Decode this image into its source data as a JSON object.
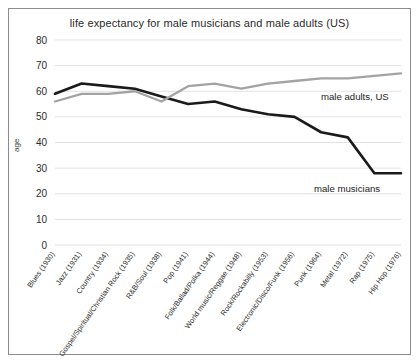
{
  "chart_data": {
    "type": "line",
    "title": "life expectancy for male musicians and male adults (US)",
    "xlabel": "",
    "ylabel": "age",
    "ylim": [
      0,
      80
    ],
    "ytick_values": [
      0,
      10,
      20,
      30,
      40,
      50,
      60,
      70,
      80
    ],
    "grid": true,
    "legend_position": "inline-annotation",
    "categories": [
      "Blues (1930)",
      "Jazz (1931)",
      "Country (1934)",
      "Gospel/Spiritual/Christian Rock (1935)",
      "R&B/Soul (1938)",
      "Pop (1941)",
      "Folk/Ballad/Polka (1944)",
      "World music/Reggae (1948)",
      "Rock/Rockabilly (1953)",
      "Electronic/Disco/Funk (1956)",
      "Punk (1964)",
      "Metal (1972)",
      "Rap (1975)",
      "Hip Hop (1976)"
    ],
    "series": [
      {
        "name": "male musicians",
        "color": "#1a1a1a",
        "values": [
          59,
          63,
          62,
          61,
          58,
          55,
          56,
          53,
          51,
          50,
          44,
          42,
          28,
          28
        ]
      },
      {
        "name": "male adults, US",
        "color": "#a3a3a3",
        "values": [
          56,
          59,
          59,
          60,
          56,
          62,
          63,
          61,
          63,
          64,
          65,
          65,
          66,
          67
        ]
      }
    ],
    "annotations": [
      {
        "text": "male adults, US",
        "series": "male adults, US"
      },
      {
        "text": "male musicians",
        "series": "male musicians"
      }
    ]
  }
}
